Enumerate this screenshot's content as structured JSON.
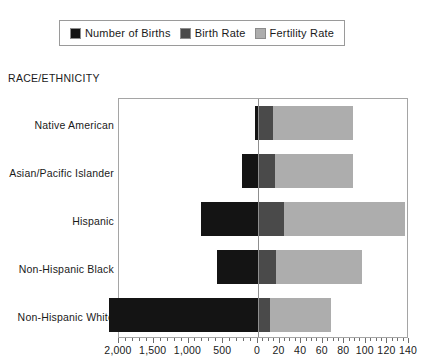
{
  "legend": {
    "items": [
      {
        "label": "Number of Births",
        "color": "#141414",
        "key": "births"
      },
      {
        "label": "Birth Rate",
        "color": "#4a4a4a",
        "key": "birth_rate"
      },
      {
        "label": "Fertility Rate",
        "color": "#adadad",
        "key": "fertility_rate"
      }
    ]
  },
  "axis": {
    "y_title": "RACE/ETHNICITY",
    "left_ticks": [
      "2,000",
      "1,500",
      "1,000",
      "500",
      "0"
    ],
    "right_ticks": [
      "0",
      "20",
      "40",
      "60",
      "80",
      "100",
      "120",
      "140"
    ]
  },
  "chart_data": {
    "type": "bar",
    "orientation": "horizontal",
    "title": "",
    "xlabel": "",
    "ylabel": "RACE/ETHNICITY",
    "grid": false,
    "legend_position": "top",
    "note": "Diverging bar chart. Number of Births extends left of zero on a reversed 0-2,000 (thousands) scale; Birth Rate and Fertility Rate stack rightward on a 0-140 scale.",
    "categories": [
      "Native American",
      "Asian/Pacific Islander",
      "Hispanic",
      "Non-Hispanic Black",
      "Non-Hispanic White"
    ],
    "left_axis": {
      "label": "Number of Births",
      "min": 0,
      "max": 2000,
      "reversed": true,
      "tick_step": 500,
      "minor_step": 100
    },
    "right_axis": {
      "label": "Rate",
      "min": 0,
      "max": 140,
      "tick_step": 20,
      "minor_step": 5
    },
    "series": [
      {
        "name": "Number of Births",
        "color": "#141414",
        "axis": "left",
        "values": [
          45,
          235,
          820,
          590,
          2150
        ]
      },
      {
        "name": "Birth Rate",
        "color": "#4a4a4a",
        "axis": "right",
        "values": [
          14,
          16,
          24,
          17,
          11
        ]
      },
      {
        "name": "Fertility Rate",
        "color": "#adadad",
        "axis": "right",
        "values": [
          74,
          72,
          112,
          79,
          57
        ]
      }
    ],
    "stacked_right_totals": [
      88,
      88,
      136,
      96,
      68
    ]
  }
}
